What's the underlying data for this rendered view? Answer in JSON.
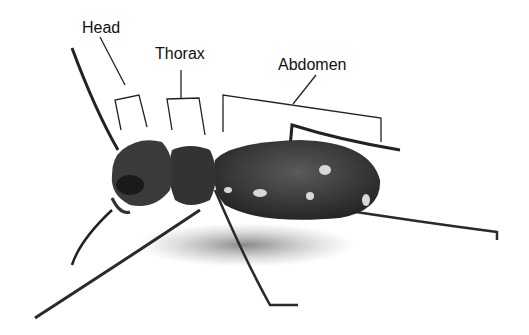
{
  "diagram": {
    "labels": [
      {
        "id": "head",
        "text": "Head"
      },
      {
        "id": "thorax",
        "text": "Thorax"
      },
      {
        "id": "abdomen",
        "text": "Abdomen"
      }
    ],
    "colors": {
      "background": "#ffffff",
      "label_text": "#111111",
      "leader_line": "#222222",
      "beetle_body": "#3a3a3a",
      "beetle_dark": "#1a1a1a",
      "spots": "#d8d8d8"
    }
  }
}
